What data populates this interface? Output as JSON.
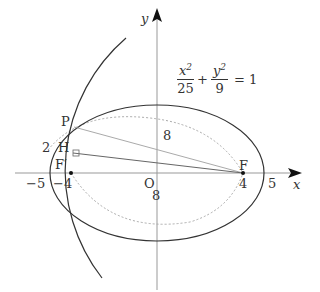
{
  "diagram": {
    "equation": {
      "x_num": "x",
      "x_den": "25",
      "plus": "+",
      "y_num": "y",
      "y_den": "9",
      "equals": "= 1",
      "exp": "2"
    },
    "axes": {
      "x_label": "x",
      "y_label": "y"
    },
    "ticks": {
      "neg5": "−5",
      "neg4": "−4",
      "origin": "O",
      "pos4": "4",
      "pos5": "5"
    },
    "points": {
      "P": "P",
      "H": "H",
      "F_prime": "F′",
      "F": "F"
    },
    "annotations": {
      "two": "2",
      "eight_top": "8",
      "eight_bottom": "8"
    },
    "colors": {
      "stroke": "#333333",
      "light": "#999999"
    }
  }
}
